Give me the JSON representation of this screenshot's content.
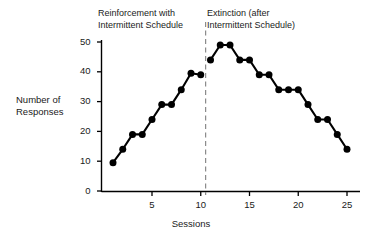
{
  "chart_data": {
    "type": "line",
    "title": "",
    "xlabel": "Sessions",
    "ylabel": "Number of\nResponses",
    "xlim": [
      0.2,
      25.8
    ],
    "ylim": [
      0,
      52
    ],
    "grid": false,
    "legend_position": "none",
    "x_ticks": [
      5,
      10,
      15,
      20,
      25
    ],
    "y_ticks": [
      0,
      10,
      20,
      30,
      40,
      50
    ],
    "x": [
      1,
      2,
      3,
      4,
      5,
      6,
      7,
      8,
      9,
      10,
      11,
      12,
      13,
      14,
      15,
      16,
      17,
      18,
      19,
      20,
      21,
      22,
      23,
      24,
      25
    ],
    "series": [
      {
        "name": "Reinforcement with Intermittent Schedule",
        "x": [
          1,
          2,
          3,
          4,
          5,
          6,
          7,
          8,
          9,
          10
        ],
        "values": [
          9.5,
          14,
          19,
          19,
          24,
          29,
          29,
          34,
          39.5,
          39
        ]
      },
      {
        "name": "Extinction (after Intermittent Schedule)",
        "x": [
          11,
          12,
          13,
          14,
          15,
          16,
          17,
          18,
          19,
          20,
          21,
          22,
          23,
          24,
          25
        ],
        "values": [
          44,
          49,
          49,
          44,
          44,
          39,
          39,
          34,
          34,
          34,
          29,
          24,
          24,
          19,
          14
        ]
      }
    ],
    "annotations": [
      {
        "name": "phase-divider",
        "type": "vertical-dashed-line",
        "x": 10.5
      }
    ],
    "marker": "filled-circle",
    "marker_color": "#000000",
    "line_color": "#000000"
  },
  "labels": {
    "phase_left": "Reinforcement with\nIntermittent Schedule",
    "phase_right": "Extinction (after\nIntermittent Schedule)",
    "y_axis_title": "Number of\nResponses",
    "x_axis_title": "Sessions",
    "y_ticks": [
      "0",
      "10",
      "20",
      "30",
      "40",
      "50"
    ],
    "x_ticks": [
      "5",
      "10",
      "15",
      "20",
      "25"
    ]
  },
  "colors": {
    "ink": "#1a1a1a",
    "axis": "#000000",
    "marker": "#000000",
    "divider": "#808080",
    "background": "#ffffff"
  }
}
